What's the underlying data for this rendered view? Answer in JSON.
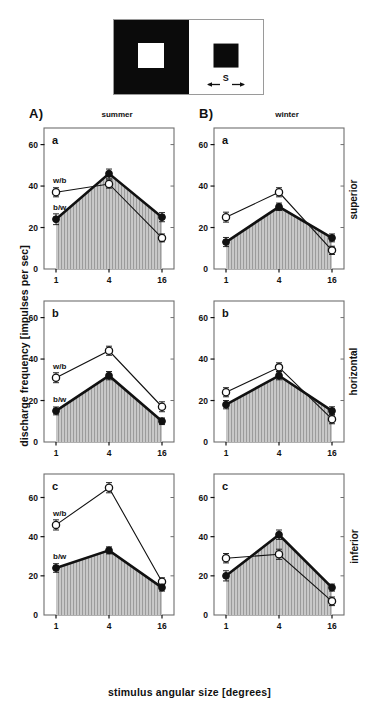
{
  "figure": {
    "y_axis_title": "discharge frequency [impulses per sec]",
    "x_axis_title": "stimulus angular size [degrees]",
    "panels": {
      "A": {
        "letter": "A)",
        "title": "summer"
      },
      "B": {
        "letter": "B)",
        "title": "winter"
      }
    },
    "row_titles": [
      "superior",
      "horizontal",
      "inferior"
    ],
    "sub_letters": [
      "a",
      "b",
      "c"
    ],
    "series_labels": {
      "white_on_black": "w/b",
      "black_on_white": "b/w"
    }
  },
  "stimulus": {
    "name": "stimulus-diagram",
    "left_patch": "black surround with white centre square",
    "right_patch": "white surround with black centre square",
    "size_marker_label": "S"
  },
  "chart_data": [
    {
      "id": "A-a",
      "type": "line",
      "title": "summer",
      "sub_letter": "a",
      "panel": "A",
      "row": "superior",
      "xlabel": "stimulus angular size [degrees]",
      "ylabel": "discharge frequency [impulses per sec]",
      "categories": [
        "1",
        "4",
        "16"
      ],
      "x_tick_labels": [
        "1",
        "4",
        "16"
      ],
      "y_tick_labels": [
        "0",
        "20",
        "40",
        "60"
      ],
      "y_ticks": [
        0,
        20,
        40,
        60
      ],
      "ylim": [
        0,
        68
      ],
      "grid": false,
      "legend": "inline",
      "series": [
        {
          "name": "b/w",
          "marker": "filled-circle",
          "shaded": true,
          "values": [
            24,
            46,
            25
          ],
          "errors": [
            2.6,
            2.2,
            2.2
          ]
        },
        {
          "name": "w/b",
          "marker": "open-circle",
          "shaded": false,
          "values": [
            37,
            41,
            15
          ],
          "errors": [
            2.2,
            2.0,
            1.9
          ]
        }
      ]
    },
    {
      "id": "B-a",
      "type": "line",
      "title": "winter",
      "sub_letter": "a",
      "panel": "B",
      "row": "superior",
      "categories": [
        "1",
        "4",
        "16"
      ],
      "x_tick_labels": [
        "1",
        "4",
        "16"
      ],
      "y_tick_labels": [
        "0",
        "20",
        "40",
        "60"
      ],
      "y_ticks": [
        0,
        20,
        40,
        60
      ],
      "ylim": [
        0,
        68
      ],
      "grid": false,
      "series": [
        {
          "name": "b/w",
          "marker": "filled-circle",
          "shaded": true,
          "values": [
            13,
            30,
            15
          ],
          "errors": [
            2.2,
            1.8,
            1.9
          ]
        },
        {
          "name": "w/b",
          "marker": "open-circle",
          "shaded": false,
          "values": [
            25,
            37,
            9
          ],
          "errors": [
            2.4,
            2.2,
            2.0
          ]
        }
      ]
    },
    {
      "id": "A-b",
      "type": "line",
      "title": "summer",
      "sub_letter": "b",
      "panel": "A",
      "row": "horizontal",
      "categories": [
        "1",
        "4",
        "16"
      ],
      "x_tick_labels": [
        "1",
        "4",
        "16"
      ],
      "y_tick_labels": [
        "0",
        "20",
        "40",
        "60"
      ],
      "y_ticks": [
        0,
        20,
        40,
        60
      ],
      "ylim": [
        0,
        68
      ],
      "grid": false,
      "series": [
        {
          "name": "b/w",
          "marker": "filled-circle",
          "shaded": true,
          "values": [
            15,
            32,
            10
          ],
          "errors": [
            1.9,
            2.0,
            1.6
          ]
        },
        {
          "name": "w/b",
          "marker": "open-circle",
          "shaded": false,
          "values": [
            31,
            44,
            17
          ],
          "errors": [
            2.4,
            2.2,
            2.4
          ]
        }
      ]
    },
    {
      "id": "B-b",
      "type": "line",
      "title": "winter",
      "sub_letter": "b",
      "panel": "B",
      "row": "horizontal",
      "categories": [
        "1",
        "4",
        "16"
      ],
      "x_tick_labels": [
        "1",
        "4",
        "16"
      ],
      "y_tick_labels": [
        "0",
        "20",
        "40",
        "60"
      ],
      "y_ticks": [
        0,
        20,
        40,
        60
      ],
      "ylim": [
        0,
        68
      ],
      "grid": false,
      "series": [
        {
          "name": "b/w",
          "marker": "filled-circle",
          "shaded": true,
          "values": [
            18,
            32,
            15
          ],
          "errors": [
            2.0,
            2.0,
            2.0
          ]
        },
        {
          "name": "w/b",
          "marker": "open-circle",
          "shaded": false,
          "values": [
            24,
            36,
            11
          ],
          "errors": [
            2.2,
            2.2,
            2.2
          ]
        }
      ]
    },
    {
      "id": "A-c",
      "type": "line",
      "title": "summer",
      "sub_letter": "c",
      "panel": "A",
      "row": "inferior",
      "categories": [
        "1",
        "4",
        "16"
      ],
      "x_tick_labels": [
        "1",
        "4",
        "16"
      ],
      "y_tick_labels": [
        "0",
        "20",
        "40",
        "60"
      ],
      "y_ticks": [
        0,
        20,
        40,
        60
      ],
      "ylim": [
        0,
        72
      ],
      "grid": false,
      "series": [
        {
          "name": "b/w",
          "marker": "filled-circle",
          "shaded": true,
          "values": [
            24,
            33,
            14
          ],
          "errors": [
            2.2,
            1.8,
            1.8
          ]
        },
        {
          "name": "w/b",
          "marker": "open-circle",
          "shaded": false,
          "values": [
            46,
            65,
            17
          ],
          "errors": [
            2.6,
            2.6,
            2.0
          ]
        }
      ]
    },
    {
      "id": "B-c",
      "type": "line",
      "title": "winter",
      "sub_letter": "c",
      "panel": "B",
      "row": "inferior",
      "categories": [
        "1",
        "4",
        "16"
      ],
      "x_tick_labels": [
        "1",
        "4",
        "16"
      ],
      "y_tick_labels": [
        "0",
        "20",
        "40",
        "60"
      ],
      "y_ticks": [
        0,
        20,
        40,
        60
      ],
      "ylim": [
        0,
        72
      ],
      "grid": false,
      "series": [
        {
          "name": "b/w",
          "marker": "filled-circle",
          "shaded": true,
          "values": [
            20,
            41,
            14
          ],
          "errors": [
            2.6,
            2.4,
            1.8
          ]
        },
        {
          "name": "w/b",
          "marker": "open-circle",
          "shaded": false,
          "values": [
            29,
            31,
            7
          ],
          "errors": [
            2.4,
            2.6,
            2.2
          ]
        }
      ]
    }
  ],
  "colors": {
    "ink": "#111111",
    "hatch": "#9b9b9b",
    "fill": "#c9c9c9",
    "frame": "#6f6f6f",
    "background": "#ffffff"
  }
}
